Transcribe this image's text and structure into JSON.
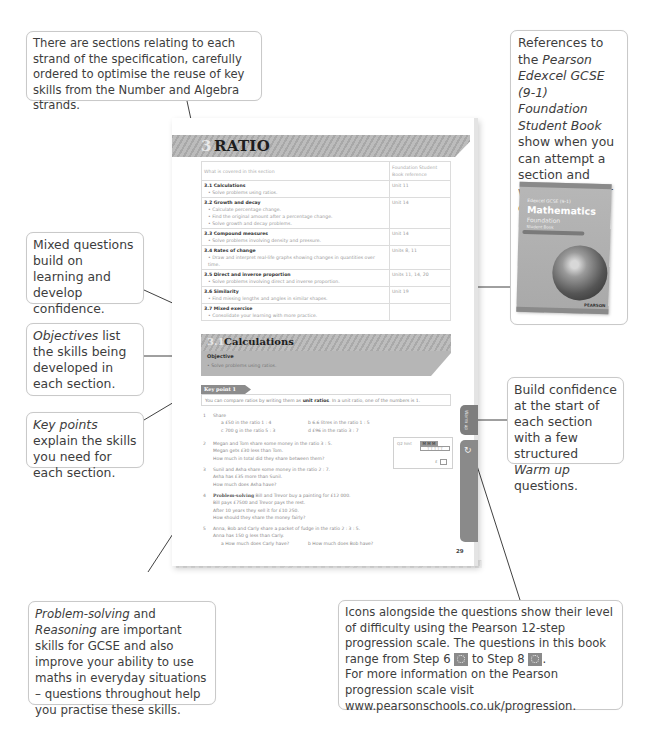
{
  "callouts": {
    "sections": "There are sections relating to each strand of the specification, carefully ordered to optimise the reuse of key skills from the Number and Algebra strands.",
    "references": {
      "pre": "References to the ",
      "italic": "Pearson Edexcel GCSE (9-1) Foundation Student Book",
      "post": " show when you can attempt a section and where to go for extra support."
    },
    "mixed": "Mixed questions build on learning and develop confidence.",
    "objectives": {
      "italic": "Objectives",
      "post": " list the skills being developed in each section."
    },
    "keypoints": {
      "italic": "Key points",
      "post": " explain the skills you need for each section."
    },
    "warmup": {
      "pre": "Build confidence at the start of each section with a few structured ",
      "italic": "Warm up",
      "post": " questions."
    },
    "problem": {
      "italic1": "Problem-solving",
      "mid": " and ",
      "italic2": "Reasoning",
      "post": " are important skills for GCSE and also improve your ability to use maths in everyday situations – questions throughout help you practise these skills."
    },
    "icons": {
      "line1": "Icons alongside the questions show their level of difficulty using the Pearson 12-step progression scale. The questions in this book range from Step 6",
      "mid": " to Step 8",
      "end": ".",
      "line2": "For more information on the Pearson progression scale visit  www.pearsonschools.co.uk/progression."
    }
  },
  "page": {
    "chapter_number": "3",
    "chapter_title": "RATIO",
    "toc_header": [
      "What is covered in this section",
      "Foundation Student Book reference"
    ],
    "toc": [
      {
        "title": "3.1 Calculations",
        "bullets": [
          "Solve problems using ratios."
        ],
        "ref": "Unit 11"
      },
      {
        "title": "3.2 Growth and decay",
        "bullets": [
          "Calculate percentage change.",
          "Find the original amount after a percentage change.",
          "Solve growth and decay problems."
        ],
        "ref": "Unit 14"
      },
      {
        "title": "3.3 Compound measures",
        "bullets": [
          "Solve problems involving density and pressure."
        ],
        "ref": "Unit 14"
      },
      {
        "title": "3.4 Rates of change",
        "bullets": [
          "Draw and interpret real-life graphs showing changes in quantities over time."
        ],
        "ref": "Units 8, 11"
      },
      {
        "title": "3.5 Direct and inverse proportion",
        "bullets": [
          "Solve problems involving direct and inverse proportion."
        ],
        "ref": "Units 11, 14, 20"
      },
      {
        "title": "3.6 Similarity",
        "bullets": [
          "Find missing lengths and angles in similar shapes."
        ],
        "ref": "Unit 19"
      },
      {
        "title": "3.7 Mixed exercise",
        "bullets": [
          "Consolidate your learning with more practice."
        ],
        "ref": ""
      }
    ],
    "section": {
      "number": "3.1",
      "title": "Calculations",
      "objective_label": "Objective",
      "objective_item": "Solve problems using ratios."
    },
    "key_point": {
      "label": "Key point 1",
      "text_pre": "You can compare ratios by writing them as ",
      "text_bold": "unit ratios",
      "text_post": ". In a unit ratio, one of the numbers is 1."
    },
    "questions": {
      "q1": {
        "n": "1",
        "stem": "Share",
        "a": "a   £50 in the ratio 1 : 4",
        "b": "b   6.6 litres in the ratio 1 : 5",
        "c": "c   700 g in the ratio 5 : 3",
        "d": "d   £96 in the ratio 3 : 7"
      },
      "q2": {
        "n": "2",
        "l1": "Megan and Tom share some money in the ratio 3 : 5.",
        "l2": "Megan gets £30 less than Tom.",
        "l3": "How much in total did they share between them?"
      },
      "q3": {
        "n": "3",
        "l1": "Sunil and Asha share some money in the ratio 2 : 7.",
        "l2": "Asha has £35 more than Sunil.",
        "l3": "How much does Asha have?"
      },
      "q4": {
        "n": "4",
        "label": "Problem-solving",
        "l1": " Bill and Trevor buy a painting for £12 000.",
        "l2": "Bill pays £7500 and Trevor pays the rest.",
        "l3": "After 10 years they sell it for £10 250.",
        "l4": "How should they share the money fairly?"
      },
      "q5": {
        "n": "5",
        "l1": "Anna, Bob and Carly share a packet of fudge in the ratio 2 : 3 : 5.",
        "l2": "Anna has 150 g less than Carly.",
        "a": "a   How much does Carly have?",
        "b": "b   How much does Bob have?"
      }
    },
    "qbox": {
      "hint": "Q2 hint",
      "mm": "M M M",
      "tt": "T T T T T",
      "pound": "£"
    },
    "warm_up_tab": "Warm up",
    "page_number": "29"
  },
  "book_cover": {
    "line1": "Edexcel GCSE (9-1)",
    "title": "Mathematics",
    "subtitle": "Foundation",
    "type": "Student Book",
    "publisher": "PEARSON"
  }
}
